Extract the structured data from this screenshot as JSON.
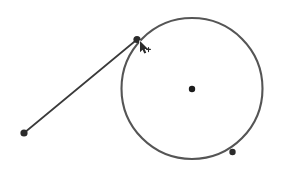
{
  "canvas": {
    "width": 282,
    "height": 174,
    "background_color": "#ffffff",
    "title": "Geometry construction canvas"
  },
  "palette": {
    "circle_stroke": "#555555",
    "line_stroke": "#3a3a3a",
    "point_fill": "#2b2b2b",
    "center_point_fill": "#1c1c1c",
    "cursor_fill": "#2b2b2b",
    "cursor_outline": "#ffffff"
  },
  "figure": {
    "type": "circle-with-secant-line",
    "circle": {
      "name": "main-circle",
      "center_x": 192,
      "center_y": 88.5,
      "radius": 70.5,
      "stroke_width": 2.1,
      "stroke_color": "#555555",
      "fill": "none"
    },
    "points": [
      {
        "id": "center-point",
        "label": "",
        "x": 192,
        "y": 89,
        "radius": 3.2,
        "fill": "#1c1c1c",
        "on_circle": false,
        "role": "circle-center"
      },
      {
        "id": "line-circle-point",
        "label": "",
        "x": 137,
        "y": 39.5,
        "radius": 3.6,
        "fill": "#2b2b2b",
        "on_circle": true,
        "role": "line-endpoint-on-circle"
      },
      {
        "id": "free-point",
        "label": "",
        "x": 24,
        "y": 133,
        "radius": 3.6,
        "fill": "#2b2b2b",
        "on_circle": false,
        "role": "line-free-endpoint"
      },
      {
        "id": "circle-point-lower-right",
        "label": "",
        "x": 232.5,
        "y": 152,
        "radius": 3.2,
        "fill": "#2b2b2b",
        "on_circle": true,
        "role": "point-on-circle"
      }
    ],
    "segments": [
      {
        "id": "ray-segment",
        "from_x": 24,
        "from_y": 133,
        "to_x": 137,
        "to_y": 39.5,
        "stroke_width": 1.7,
        "stroke_color": "#3a3a3a"
      }
    ]
  },
  "cursor": {
    "name": "arrow-pointer-cursor",
    "shape": "arrow-with-small-glyph",
    "x": 140,
    "y": 41,
    "width": 11,
    "height": 14,
    "fill": "#2b2b2b",
    "outline": "#ffffff"
  }
}
